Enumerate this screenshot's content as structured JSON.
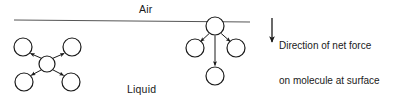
{
  "figure": {
    "title_labels": {
      "air": "Air",
      "liquid": "Liquid"
    },
    "annotation": {
      "line1": "Direction of net force",
      "line2": "on molecule at surface",
      "arrow_icon": "down-arrow-icon"
    },
    "colors": {
      "stroke": "#1a1a1a",
      "background": "#ffffff",
      "text": "#1a1a1a",
      "surface_line": "#555555"
    },
    "surface_line": {
      "x1": 14,
      "y1": 20,
      "x2": 250,
      "y2": 22
    },
    "bulk_molecule_group": {
      "caption": "molecule in bulk liquid with balanced forces",
      "center": {
        "cx": 47,
        "cy": 64,
        "r": 8
      },
      "neighbors": [
        {
          "name": "top-left",
          "cx": 23,
          "cy": 47,
          "r": 9
        },
        {
          "name": "top-right",
          "cx": 72,
          "cy": 47,
          "r": 9
        },
        {
          "name": "bottom-left",
          "cx": 24,
          "cy": 82,
          "r": 9
        },
        {
          "name": "bottom-right",
          "cx": 71,
          "cy": 82,
          "r": 9
        }
      ],
      "arrow_count": 4,
      "arrow_direction": "outward-diagonal"
    },
    "surface_molecule_group": {
      "caption": "molecule at surface with net downward force",
      "center": {
        "cx": 215,
        "cy": 26,
        "r": 9
      },
      "neighbors": [
        {
          "name": "lower-left",
          "cx": 195,
          "cy": 48,
          "r": 9
        },
        {
          "name": "lower-right",
          "cx": 236,
          "cy": 48,
          "r": 9
        },
        {
          "name": "below",
          "cx": 215,
          "cy": 76,
          "r": 9
        }
      ],
      "arrow_count": 3,
      "arrow_direction": "downward"
    },
    "net_force_arrow": {
      "x": 272,
      "y_start": 18,
      "y_end": 43
    }
  }
}
